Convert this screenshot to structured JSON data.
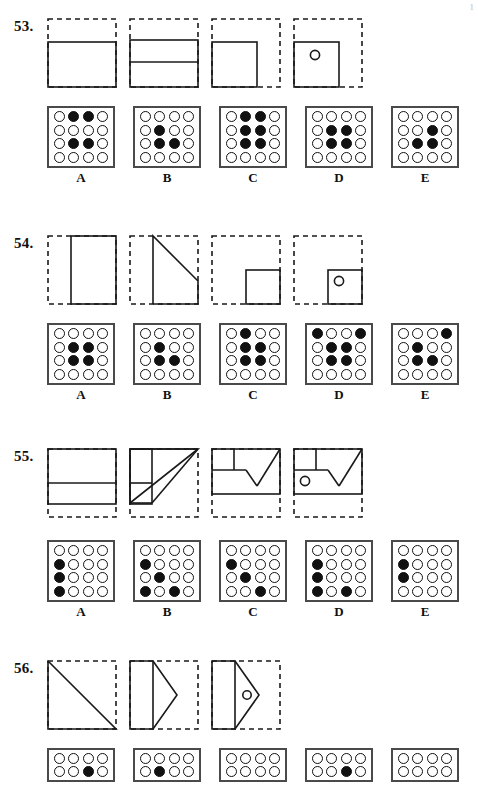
{
  "page": {
    "corner_mark": "1"
  },
  "colors": {
    "ink": "#111111",
    "dot_fill": "#111111",
    "grid_border": "#4a4a4a",
    "dash": "#1a1a1a"
  },
  "problems": [
    {
      "number": "53.",
      "top": 18,
      "figure_top": 0,
      "options_top": 88,
      "grid_rows": 4,
      "grid_cols": 4,
      "figures": [
        {
          "name": "fold-step-1",
          "kind": "fold-horizontal-2of3"
        },
        {
          "name": "fold-step-2",
          "kind": "fold-horizontal-2of3-extra-line"
        },
        {
          "name": "fold-step-3",
          "kind": "fold-square-left"
        },
        {
          "name": "fold-step-4-punch",
          "kind": "fold-square-left-hole"
        }
      ],
      "options": [
        {
          "label": "A",
          "dots": [
            [
              0,
              1,
              1,
              0
            ],
            [
              0,
              0,
              0,
              0
            ],
            [
              0,
              1,
              1,
              0
            ],
            [
              0,
              0,
              0,
              0
            ]
          ]
        },
        {
          "label": "B",
          "dots": [
            [
              0,
              0,
              0,
              0
            ],
            [
              0,
              1,
              0,
              0
            ],
            [
              0,
              1,
              1,
              0
            ],
            [
              0,
              0,
              0,
              0
            ]
          ]
        },
        {
          "label": "C",
          "dots": [
            [
              0,
              1,
              1,
              0
            ],
            [
              0,
              1,
              1,
              0
            ],
            [
              0,
              1,
              1,
              0
            ],
            [
              0,
              0,
              0,
              0
            ]
          ]
        },
        {
          "label": "D",
          "dots": [
            [
              0,
              0,
              0,
              0
            ],
            [
              0,
              1,
              1,
              0
            ],
            [
              0,
              1,
              1,
              0
            ],
            [
              0,
              0,
              0,
              0
            ]
          ]
        },
        {
          "label": "E",
          "dots": [
            [
              0,
              0,
              0,
              0
            ],
            [
              0,
              0,
              1,
              0
            ],
            [
              0,
              1,
              1,
              0
            ],
            [
              0,
              0,
              0,
              0
            ]
          ]
        }
      ]
    },
    {
      "number": "54.",
      "top": 235,
      "figure_top": 0,
      "options_top": 88,
      "grid_rows": 4,
      "grid_cols": 4,
      "figures": [
        {
          "name": "fold-step-1",
          "kind": "fold-vertical-right-half"
        },
        {
          "name": "fold-step-2",
          "kind": "fold-vertical-diagonal"
        },
        {
          "name": "fold-step-3",
          "kind": "fold-small-square-right"
        },
        {
          "name": "fold-step-4-punch",
          "kind": "fold-small-square-right-hole"
        }
      ],
      "options": [
        {
          "label": "A",
          "dots": [
            [
              0,
              0,
              0,
              0
            ],
            [
              0,
              1,
              1,
              0
            ],
            [
              0,
              1,
              1,
              0
            ],
            [
              0,
              0,
              0,
              0
            ]
          ]
        },
        {
          "label": "B",
          "dots": [
            [
              0,
              0,
              0,
              0
            ],
            [
              0,
              1,
              0,
              0
            ],
            [
              0,
              1,
              1,
              0
            ],
            [
              0,
              0,
              0,
              0
            ]
          ]
        },
        {
          "label": "C",
          "dots": [
            [
              0,
              1,
              0,
              0
            ],
            [
              0,
              1,
              1,
              0
            ],
            [
              0,
              1,
              1,
              0
            ],
            [
              0,
              0,
              0,
              0
            ]
          ]
        },
        {
          "label": "D",
          "dots": [
            [
              1,
              0,
              0,
              1
            ],
            [
              0,
              1,
              1,
              0
            ],
            [
              0,
              1,
              1,
              0
            ],
            [
              0,
              0,
              0,
              0
            ]
          ]
        },
        {
          "label": "E",
          "dots": [
            [
              0,
              0,
              0,
              1
            ],
            [
              0,
              1,
              0,
              0
            ],
            [
              0,
              1,
              1,
              0
            ],
            [
              0,
              0,
              0,
              0
            ]
          ]
        }
      ]
    },
    {
      "number": "55.",
      "top": 448,
      "figure_top": 0,
      "options_top": 92,
      "grid_rows": 4,
      "grid_cols": 4,
      "figures": [
        {
          "name": "fold-step-1",
          "kind": "fold55-1"
        },
        {
          "name": "fold-step-2",
          "kind": "fold55-2"
        },
        {
          "name": "fold-step-3",
          "kind": "fold55-3"
        },
        {
          "name": "fold-step-4-punch",
          "kind": "fold55-4"
        }
      ],
      "options": [
        {
          "label": "A",
          "dots": [
            [
              0,
              0,
              0,
              0
            ],
            [
              1,
              0,
              0,
              0
            ],
            [
              1,
              0,
              0,
              0
            ],
            [
              1,
              0,
              0,
              0
            ]
          ]
        },
        {
          "label": "B",
          "dots": [
            [
              0,
              0,
              0,
              0
            ],
            [
              1,
              0,
              0,
              0
            ],
            [
              0,
              1,
              0,
              0
            ],
            [
              1,
              0,
              1,
              0
            ]
          ]
        },
        {
          "label": "C",
          "dots": [
            [
              0,
              0,
              0,
              0
            ],
            [
              1,
              0,
              0,
              0
            ],
            [
              0,
              1,
              0,
              0
            ],
            [
              0,
              0,
              1,
              0
            ]
          ]
        },
        {
          "label": "D",
          "dots": [
            [
              0,
              0,
              0,
              0
            ],
            [
              1,
              0,
              0,
              0
            ],
            [
              1,
              0,
              0,
              0
            ],
            [
              1,
              0,
              1,
              0
            ]
          ]
        },
        {
          "label": "E",
          "dots": [
            [
              0,
              0,
              0,
              0
            ],
            [
              1,
              0,
              0,
              0
            ],
            [
              1,
              0,
              0,
              0
            ],
            [
              0,
              0,
              0,
              0
            ]
          ]
        }
      ]
    },
    {
      "number": "56.",
      "top": 660,
      "figure_top": 0,
      "options_top": 88,
      "grid_rows": 2,
      "grid_cols": 4,
      "clipped": true,
      "figures": [
        {
          "name": "fold-step-1",
          "kind": "fold56-1"
        },
        {
          "name": "fold-step-2",
          "kind": "fold56-2"
        },
        {
          "name": "fold-step-3",
          "kind": "fold56-3"
        }
      ],
      "options": [
        {
          "label": "",
          "dots": [
            [
              0,
              0,
              0,
              0
            ],
            [
              0,
              0,
              1,
              0
            ]
          ]
        },
        {
          "label": "",
          "dots": [
            [
              0,
              0,
              0,
              0
            ],
            [
              0,
              1,
              0,
              0
            ]
          ]
        },
        {
          "label": "",
          "dots": [
            [
              0,
              0,
              0,
              0
            ],
            [
              0,
              0,
              0,
              0
            ]
          ]
        },
        {
          "label": "",
          "dots": [
            [
              0,
              0,
              0,
              0
            ],
            [
              0,
              0,
              1,
              0
            ]
          ]
        },
        {
          "label": "",
          "dots": [
            [
              0,
              0,
              0,
              0
            ],
            [
              0,
              0,
              0,
              0
            ]
          ]
        }
      ]
    }
  ]
}
